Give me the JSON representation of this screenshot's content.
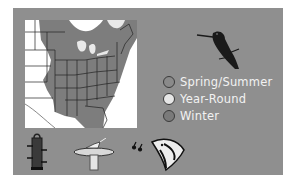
{
  "infographic": {
    "colors": {
      "panel": "#8f8f8f",
      "map_background": "#ffffff",
      "range_fill": "#7d7d7d",
      "state_lines": "#222222",
      "legend_text": "#f2f2f2"
    },
    "map": {
      "icon": "us-range-map",
      "region": "Eastern United States"
    },
    "bird": {
      "icon": "hummingbird-silhouette"
    },
    "legend": {
      "items": [
        {
          "label": "Spring/Summer",
          "color": "#8a8a8a"
        },
        {
          "label": "Year-Round",
          "color": "#e6e6e6"
        },
        {
          "label": "Winter",
          "color": "#7a7a7a"
        }
      ]
    },
    "activities": [
      {
        "icon": "bird-feeder-icon"
      },
      {
        "icon": "birdbath-icon"
      },
      {
        "icon": "bird-song-icon"
      }
    ]
  }
}
